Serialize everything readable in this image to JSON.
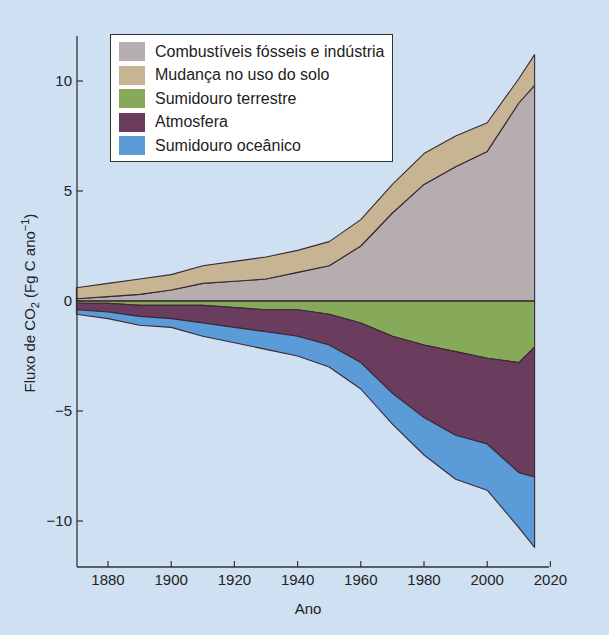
{
  "chart_data": {
    "type": "area",
    "title": "",
    "xlabel": "Ano",
    "ylabel": "Fluxo de CO₂ (Fg C ano⁻¹)",
    "ylabel_parts": {
      "prefix": "Fluxo de CO",
      "sub": "2",
      "mid": " (Fg C ano",
      "sup": "−1",
      "suffix": ")"
    },
    "xlim": [
      1870,
      2020
    ],
    "ylim": [
      -12,
      12
    ],
    "xticks": [
      1880,
      1900,
      1920,
      1940,
      1960,
      1980,
      2000,
      2020
    ],
    "yticks": [
      10,
      5,
      0,
      -5,
      -10
    ],
    "ytick_labels": [
      "10",
      "5",
      "0",
      "−5",
      "−10"
    ],
    "grid": false,
    "legend_position": "upper left",
    "x": [
      1870,
      1880,
      1890,
      1900,
      1910,
      1920,
      1930,
      1940,
      1950,
      1960,
      1970,
      1980,
      1990,
      2000,
      2010,
      2015
    ],
    "series": [
      {
        "name": "Combustíveis fósseis e indústria",
        "color": "#b5adaf",
        "role": "source",
        "values": [
          0.1,
          0.2,
          0.3,
          0.5,
          0.8,
          0.9,
          1.0,
          1.3,
          1.6,
          2.5,
          4.0,
          5.3,
          6.1,
          6.8,
          9.0,
          9.8
        ]
      },
      {
        "name": "Mudança no uso do solo",
        "color": "#c7b493",
        "role": "source",
        "values": [
          0.5,
          0.6,
          0.7,
          0.7,
          0.8,
          0.9,
          1.0,
          1.0,
          1.1,
          1.2,
          1.3,
          1.4,
          1.4,
          1.3,
          1.1,
          1.4
        ]
      },
      {
        "name": "Sumidouro terrestre",
        "color": "#87aa5a",
        "role": "sink",
        "values": [
          -0.1,
          -0.1,
          -0.2,
          -0.2,
          -0.2,
          -0.3,
          -0.4,
          -0.4,
          -0.6,
          -1.0,
          -1.6,
          -2.0,
          -2.3,
          -2.6,
          -2.8,
          -2.1
        ]
      },
      {
        "name": "Atmosfera",
        "color": "#6a3c5d",
        "role": "sink",
        "values": [
          -0.3,
          -0.4,
          -0.5,
          -0.6,
          -0.8,
          -0.9,
          -1.0,
          -1.2,
          -1.4,
          -1.8,
          -2.6,
          -3.3,
          -3.8,
          -3.9,
          -5.0,
          -5.9
        ]
      },
      {
        "name": "Sumidouro oceânico",
        "color": "#5b9bd8",
        "role": "sink",
        "values": [
          -0.2,
          -0.3,
          -0.4,
          -0.4,
          -0.6,
          -0.7,
          -0.8,
          -0.9,
          -1.0,
          -1.2,
          -1.4,
          -1.7,
          -2.0,
          -2.1,
          -2.5,
          -3.2
        ]
      }
    ]
  },
  "legend": {
    "items": [
      {
        "label": "Combustíveis fósseis e indústria",
        "color": "#b5adaf"
      },
      {
        "label": "Mudança no uso do solo",
        "color": "#c7b493"
      },
      {
        "label": "Sumidouro terrestre",
        "color": "#87aa5a"
      },
      {
        "label": "Atmosfera",
        "color": "#6a3c5d"
      },
      {
        "label": "Sumidouro oceânico",
        "color": "#5b9bd8"
      }
    ]
  }
}
